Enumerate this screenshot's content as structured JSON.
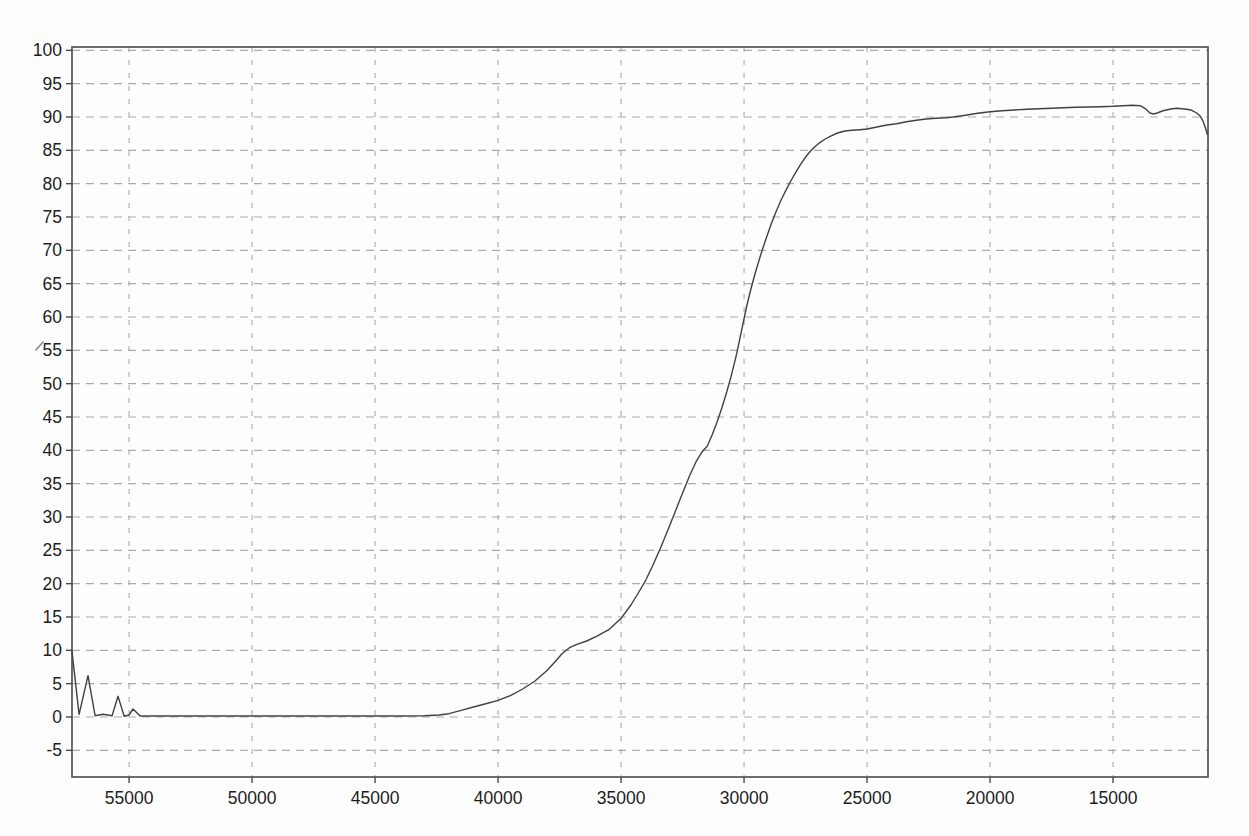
{
  "chart_data": {
    "type": "line",
    "title": "",
    "subtitle": "",
    "xlabel": "",
    "ylabel": "",
    "grid": "dashed",
    "legend": "none",
    "x_direction": "decreasing",
    "x_range": [
      57320,
      11140
    ],
    "y_range": [
      -9,
      100.5
    ],
    "x_ticks": [
      55000,
      50000,
      45000,
      40000,
      35000,
      30000,
      25000,
      20000,
      15000
    ],
    "y_ticks": [
      100,
      95,
      90,
      85,
      80,
      75,
      70,
      65,
      60,
      55,
      50,
      45,
      40,
      35,
      30,
      25,
      20,
      15,
      10,
      5,
      0,
      -5
    ],
    "colors": {
      "curve": "#414141",
      "grid": "#ababab",
      "frame": "#4a4a4a",
      "label": "#1e1e1e"
    },
    "series": [
      {
        "name": "transmission-spectrum",
        "points": [
          [
            57320,
            9.8
          ],
          [
            57030,
            0.4
          ],
          [
            56670,
            6.2
          ],
          [
            56380,
            0.2
          ],
          [
            56060,
            0.4
          ],
          [
            55690,
            0.2
          ],
          [
            55450,
            3.1
          ],
          [
            55200,
            0.1
          ],
          [
            55000,
            0.3
          ],
          [
            54840,
            1.2
          ],
          [
            54550,
            0.15
          ],
          [
            54000,
            0.15
          ],
          [
            53000,
            0.15
          ],
          [
            52000,
            0.15
          ],
          [
            51000,
            0.15
          ],
          [
            50000,
            0.15
          ],
          [
            49000,
            0.15
          ],
          [
            48000,
            0.15
          ],
          [
            47000,
            0.15
          ],
          [
            46000,
            0.15
          ],
          [
            45000,
            0.15
          ],
          [
            44000,
            0.15
          ],
          [
            43000,
            0.2
          ],
          [
            42400,
            0.3
          ],
          [
            42000,
            0.5
          ],
          [
            41500,
            1.0
          ],
          [
            41000,
            1.5
          ],
          [
            40500,
            2.0
          ],
          [
            40000,
            2.5
          ],
          [
            39500,
            3.2
          ],
          [
            39000,
            4.2
          ],
          [
            38500,
            5.4
          ],
          [
            38000,
            7.0
          ],
          [
            37700,
            8.2
          ],
          [
            37400,
            9.5
          ],
          [
            37100,
            10.4
          ],
          [
            36800,
            10.9
          ],
          [
            36400,
            11.4
          ],
          [
            36000,
            12.1
          ],
          [
            35500,
            13.1
          ],
          [
            35000,
            14.8
          ],
          [
            34600,
            16.8
          ],
          [
            34300,
            18.6
          ],
          [
            34000,
            20.5
          ],
          [
            33700,
            22.8
          ],
          [
            33400,
            25.3
          ],
          [
            33100,
            28.0
          ],
          [
            32800,
            30.8
          ],
          [
            32500,
            33.6
          ],
          [
            32200,
            36.3
          ],
          [
            31950,
            38.3
          ],
          [
            31700,
            39.8
          ],
          [
            31500,
            40.6
          ],
          [
            31300,
            42.3
          ],
          [
            31100,
            44.2
          ],
          [
            30900,
            46.4
          ],
          [
            30700,
            48.8
          ],
          [
            30500,
            51.5
          ],
          [
            30300,
            54.5
          ],
          [
            30100,
            58.0
          ],
          [
            29900,
            61.5
          ],
          [
            29700,
            64.5
          ],
          [
            29500,
            67.2
          ],
          [
            29300,
            69.6
          ],
          [
            29100,
            71.8
          ],
          [
            28900,
            73.9
          ],
          [
            28700,
            75.8
          ],
          [
            28500,
            77.5
          ],
          [
            28300,
            79.0
          ],
          [
            28100,
            80.4
          ],
          [
            27900,
            81.7
          ],
          [
            27700,
            82.9
          ],
          [
            27500,
            84.0
          ],
          [
            27300,
            84.9
          ],
          [
            27100,
            85.6
          ],
          [
            26900,
            86.2
          ],
          [
            26700,
            86.7
          ],
          [
            26500,
            87.1
          ],
          [
            26200,
            87.6
          ],
          [
            25900,
            87.9
          ],
          [
            25600,
            88.0
          ],
          [
            25300,
            88.1
          ],
          [
            25000,
            88.2
          ],
          [
            24600,
            88.5
          ],
          [
            24200,
            88.8
          ],
          [
            23800,
            89.0
          ],
          [
            23400,
            89.3
          ],
          [
            23000,
            89.5
          ],
          [
            22600,
            89.7
          ],
          [
            22200,
            89.8
          ],
          [
            21800,
            89.9
          ],
          [
            21500,
            90.0
          ],
          [
            21000,
            90.25
          ],
          [
            20500,
            90.55
          ],
          [
            20000,
            90.8
          ],
          [
            19500,
            90.95
          ],
          [
            19000,
            91.05
          ],
          [
            18500,
            91.15
          ],
          [
            18000,
            91.25
          ],
          [
            17500,
            91.3
          ],
          [
            17000,
            91.4
          ],
          [
            16500,
            91.45
          ],
          [
            16000,
            91.5
          ],
          [
            15500,
            91.55
          ],
          [
            15000,
            91.6
          ],
          [
            14600,
            91.7
          ],
          [
            14200,
            91.75
          ],
          [
            13900,
            91.7
          ],
          [
            13700,
            91.3
          ],
          [
            13500,
            90.6
          ],
          [
            13350,
            90.45
          ],
          [
            13200,
            90.6
          ],
          [
            13000,
            90.9
          ],
          [
            12800,
            91.1
          ],
          [
            12600,
            91.25
          ],
          [
            12400,
            91.3
          ],
          [
            12200,
            91.25
          ],
          [
            12000,
            91.15
          ],
          [
            11800,
            91.0
          ],
          [
            11600,
            90.6
          ],
          [
            11450,
            90.1
          ],
          [
            11330,
            89.3
          ],
          [
            11240,
            88.3
          ],
          [
            11170,
            87.4
          ]
        ]
      }
    ]
  },
  "artifacts": {
    "near_55_label": "small diagonal scan mark left of the 55 tick label"
  }
}
